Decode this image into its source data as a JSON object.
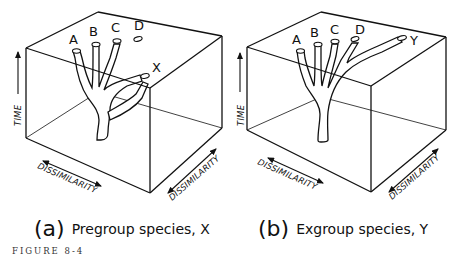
{
  "figure": {
    "label": "FIGURE 8-4"
  },
  "panels": [
    {
      "id": "a",
      "tag": "(a)",
      "caption": "Pregroup species, X",
      "species": [
        "A",
        "B",
        "C",
        "D",
        "X"
      ],
      "axes": {
        "vertical": "TIME",
        "front": "DISSIMILARITY",
        "side": "DISSIMILARITY"
      }
    },
    {
      "id": "b",
      "tag": "(b)",
      "caption": "Exgroup species, Y",
      "species": [
        "A",
        "B",
        "C",
        "D",
        "Y"
      ],
      "axes": {
        "vertical": "TIME",
        "front": "DISSIMILARITY",
        "side": "DISSIMILARITY"
      }
    }
  ],
  "colors": {
    "ink": "#111111",
    "background": "#ffffff"
  }
}
